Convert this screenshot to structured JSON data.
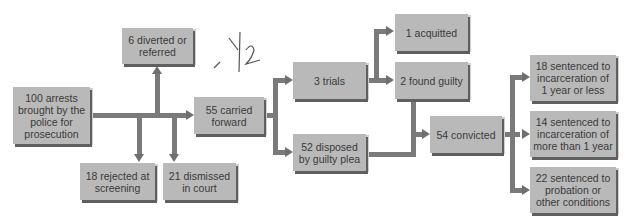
{
  "diagram": {
    "type": "flowchart",
    "nodes": {
      "arrests": "100 arrests brought by the police for prosecution",
      "diverted": "6 diverted or referred",
      "rejected": "18 rejected at screening",
      "dismissed": "21 dismissed in court",
      "carried": "55 carried forward",
      "trials": "3 trials",
      "plea": "52 disposed by guilty plea",
      "acquitted": "1 acquitted",
      "found_guilty": "2 found guilty",
      "convicted": "54 convicted",
      "sent_short": "18 sentenced to incarceration of 1 year or less",
      "sent_long": "14 sentenced to incarceration of more than 1 year",
      "probation": "22 sentenced to probation or other conditions"
    },
    "edges": [
      [
        "arrests",
        "diverted"
      ],
      [
        "arrests",
        "rejected"
      ],
      [
        "arrests",
        "dismissed"
      ],
      [
        "arrests",
        "carried"
      ],
      [
        "carried",
        "trials"
      ],
      [
        "carried",
        "plea"
      ],
      [
        "trials",
        "acquitted"
      ],
      [
        "trials",
        "found_guilty"
      ],
      [
        "found_guilty",
        "convicted"
      ],
      [
        "plea",
        "convicted"
      ],
      [
        "convicted",
        "sent_short"
      ],
      [
        "convicted",
        "sent_long"
      ],
      [
        "convicted",
        "probation"
      ]
    ],
    "handwritten_note": "- 1/2"
  }
}
